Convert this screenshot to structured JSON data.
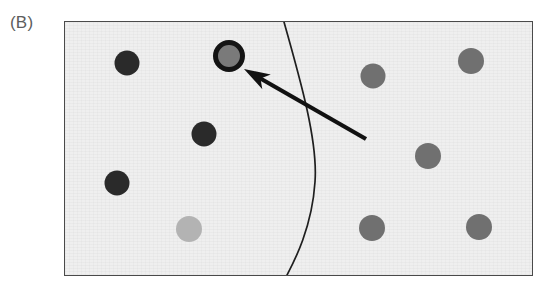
{
  "figure": {
    "panel_label": "(B)",
    "frame": {
      "x": 64,
      "y": 21,
      "width": 469,
      "height": 255
    },
    "background_color": "#efefef",
    "frame_border_color": "#4a4a4a"
  },
  "chart_data": {
    "type": "scatter",
    "title": "(B)",
    "subtitle": "",
    "xlabel": "",
    "ylabel": "",
    "xlim": [
      0,
      469
    ],
    "ylim": [
      0,
      255
    ],
    "grid": false,
    "legend": null,
    "axes_visible": false,
    "series": [
      {
        "name": "dark markers",
        "color": "#2a2a2a",
        "points": [
          {
            "id": "dot-dark-1",
            "cx": 62,
            "cy": 41,
            "r": 12.5
          },
          {
            "id": "dot-dark-2",
            "cx": 139,
            "cy": 112,
            "r": 12.5
          },
          {
            "id": "dot-dark-3",
            "cx": 52,
            "cy": 161,
            "r": 12.5
          }
        ]
      },
      {
        "name": "medium grey markers",
        "color": "#707070",
        "points": [
          {
            "id": "dot-grey-1",
            "cx": 308,
            "cy": 54,
            "r": 12.5
          },
          {
            "id": "dot-grey-2",
            "cx": 406,
            "cy": 39,
            "r": 13.0
          },
          {
            "id": "dot-grey-3",
            "cx": 363,
            "cy": 134,
            "r": 13.0
          },
          {
            "id": "dot-grey-4",
            "cx": 307,
            "cy": 206,
            "r": 13.0
          },
          {
            "id": "dot-grey-5",
            "cx": 414,
            "cy": 205,
            "r": 13.0
          }
        ]
      },
      {
        "name": "light grey marker",
        "color": "#b3b3b3",
        "points": [
          {
            "id": "dot-light-1",
            "cx": 124,
            "cy": 207,
            "r": 13.0
          }
        ]
      },
      {
        "name": "highlighted marker",
        "color": "#7a7a7a",
        "outline_color": "#141414",
        "points": [
          {
            "id": "dot-highlighted",
            "cx": 164,
            "cy": 34,
            "r": 13.5
          }
        ]
      }
    ],
    "annotations": [
      {
        "id": "divider-curve",
        "kind": "boundary-curve",
        "color": "#1f1f1f",
        "path": "M 219 0 C 236 60, 253 120, 250 160 C 247 205, 230 238, 221 255"
      },
      {
        "id": "pointer-arrow",
        "kind": "arrow",
        "color": "#111111",
        "tail": {
          "x": 301,
          "y": 117
        },
        "tip": {
          "x": 179,
          "y": 47
        },
        "label": ""
      }
    ]
  },
  "accessibility": {
    "figure_role": "Scientific figure panel B showing a scatter of shaded circles divided by a curved boundary with an arrow indicating a highlighted circle."
  }
}
